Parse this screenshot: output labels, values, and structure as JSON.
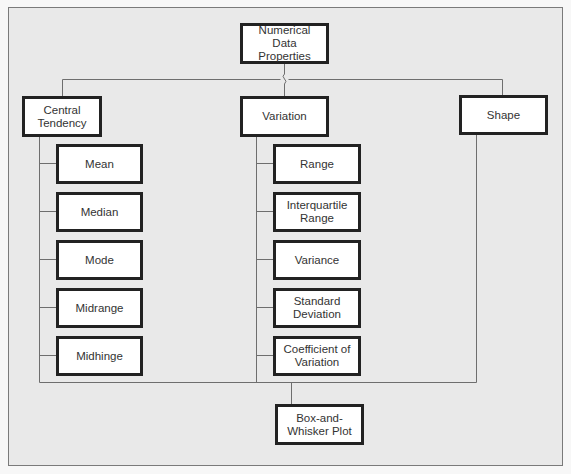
{
  "diagram": {
    "type": "hierarchy",
    "root": {
      "id": "root",
      "label": "Numerical Data Properties"
    },
    "categories": [
      {
        "id": "central",
        "label": "Central Tendency",
        "children": [
          "Mean",
          "Median",
          "Mode",
          "Midrange",
          "Midhinge"
        ]
      },
      {
        "id": "variation",
        "label": "Variation",
        "children": [
          "Range",
          "Interquartile Range",
          "Variance",
          "Standard Deviation",
          "Coefficient of Variation"
        ]
      },
      {
        "id": "shape",
        "label": "Shape",
        "children": []
      }
    ],
    "convergence": {
      "id": "boxplot",
      "label": "Box-and-Whisker Plot",
      "from": [
        "central",
        "variation",
        "shape"
      ]
    },
    "colors": {
      "background": "#e9e9e9",
      "box_fill": "#ffffff",
      "box_border": "#222222",
      "line": "#6e6e6e",
      "text": "#333333"
    }
  }
}
